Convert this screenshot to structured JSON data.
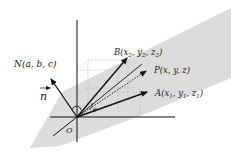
{
  "diagram": {
    "colors": {
      "plane": "#d9d9d9",
      "axis": "#111111",
      "arrow": "#111111",
      "grid": "#b5b5b5"
    },
    "labels": {
      "normal_point": "N(a, b, c)",
      "normal_vector": "n",
      "origin": "O",
      "point_b": {
        "base": "B(x",
        "s1": "2",
        "m1": ", y",
        "s2": "2",
        "m2": ", z",
        "s3": "2",
        "end": ")"
      },
      "point_p": "P(x, y, z)",
      "point_a": {
        "base": "A(x",
        "s1": "1",
        "m1": ", y",
        "s2": "1",
        "m2": ", z",
        "s3": "1",
        "end": ")"
      },
      "angle": "θ"
    }
  }
}
